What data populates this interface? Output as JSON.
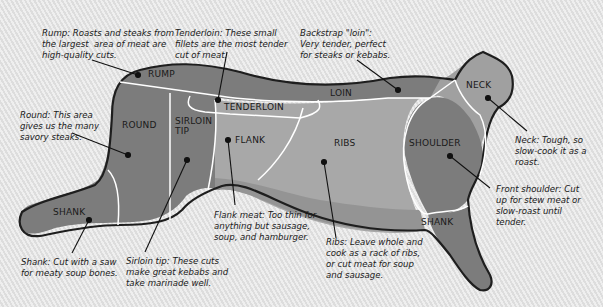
{
  "diagram": {
    "colors": {
      "background": "#e6e6e6",
      "dark_cut": "#7a7a7a",
      "mid_cut": "#9a9a9a",
      "light_cut": "#b4b4b4",
      "outline": "#1e1e1e",
      "divider": "#ffffff"
    },
    "cuts": [
      {
        "id": "rump",
        "label": "RUMP"
      },
      {
        "id": "tenderloin",
        "label": "TENDERLOIN"
      },
      {
        "id": "loin",
        "label": "LOIN"
      },
      {
        "id": "neck",
        "label": "NECK"
      },
      {
        "id": "round",
        "label": "ROUND"
      },
      {
        "id": "sirloin-tip",
        "label": "SIRLOIN\nTIP"
      },
      {
        "id": "flank",
        "label": "FLANK"
      },
      {
        "id": "ribs",
        "label": "RIBS"
      },
      {
        "id": "shoulder",
        "label": "SHOULDER"
      },
      {
        "id": "shank-rear",
        "label": "SHANK"
      },
      {
        "id": "shank-front",
        "label": "SHANK"
      }
    ],
    "notes": [
      {
        "id": "rump",
        "text": "Rump: Roasts and steaks from\nthe largest  area of meat are\nhigh-quality cuts."
      },
      {
        "id": "tenderloin",
        "text": "Tenderloin: These small\nfillets are the most tender\ncut of meat."
      },
      {
        "id": "backstrap",
        "text": "Backstrap \"loin\":\nVery tender, perfect\nfor steaks or kebabs."
      },
      {
        "id": "round",
        "text": "Round: This area\ngives us the many\nsavory steaks."
      },
      {
        "id": "neck",
        "text": "Neck: Tough, so\nslow-cook it as a\nroast."
      },
      {
        "id": "shoulder",
        "text": "Front shoulder: Cut\nup for stew meat or\nslow-roast until\ntender."
      },
      {
        "id": "flank",
        "text": "Flank meat: Too thin for\nanything but sausage,\nsoup, and hamburger."
      },
      {
        "id": "ribs",
        "text": "Ribs: Leave whole and\ncook as a rack of ribs,\nor cut meat for soup\nand sausage."
      },
      {
        "id": "shank",
        "text": "Shank: Cut with a saw\nfor meaty soup bones."
      },
      {
        "id": "sirloin-tip",
        "text": "Sirloin tip: These cuts\nmake great kebabs and\ntake marinade well."
      }
    ]
  }
}
